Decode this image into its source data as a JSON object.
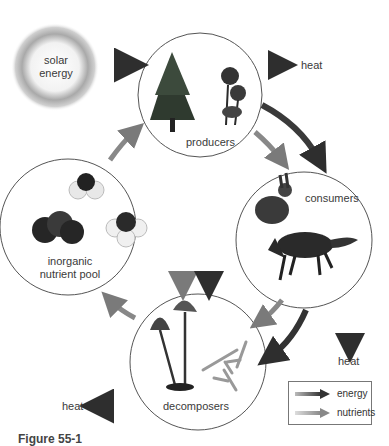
{
  "diagram": {
    "nodes": [
      {
        "id": "solar",
        "label": "solar energy",
        "lines": [
          "solar",
          "energy"
        ]
      },
      {
        "id": "producers",
        "label": "producers"
      },
      {
        "id": "consumers",
        "label": "consumers"
      },
      {
        "id": "decomposers",
        "label": "decomposers"
      },
      {
        "id": "pool",
        "label": "inorganic nutrient pool",
        "lines": [
          "inorganic",
          "nutrient pool"
        ]
      }
    ],
    "heat_labels": {
      "producers": "heat",
      "consumers": "heat",
      "decomposers": "heat"
    },
    "edges": [
      {
        "from": "solar",
        "to": "producers",
        "type": "energy"
      },
      {
        "from": "producers",
        "to": "heat",
        "type": "energy"
      },
      {
        "from": "producers",
        "to": "consumers",
        "type": "energy"
      },
      {
        "from": "producers",
        "to": "consumers",
        "type": "nutrients"
      },
      {
        "from": "producers",
        "to": "decomposers",
        "type": "energy"
      },
      {
        "from": "producers",
        "to": "decomposers",
        "type": "nutrients"
      },
      {
        "from": "consumers",
        "to": "heat",
        "type": "energy"
      },
      {
        "from": "consumers",
        "to": "decomposers",
        "type": "energy"
      },
      {
        "from": "consumers",
        "to": "decomposers",
        "type": "nutrients"
      },
      {
        "from": "decomposers",
        "to": "heat",
        "type": "energy"
      },
      {
        "from": "decomposers",
        "to": "pool",
        "type": "nutrients"
      },
      {
        "from": "pool",
        "to": "producers",
        "type": "nutrients"
      }
    ],
    "legend": {
      "energy": "energy",
      "nutrients": "nutrients"
    },
    "colors": {
      "energy_arrow": "#3a3a3a",
      "nutrient_arrow": "#8a8a8a",
      "circle_stroke": "#555555"
    }
  },
  "caption": "Figure 55-1"
}
